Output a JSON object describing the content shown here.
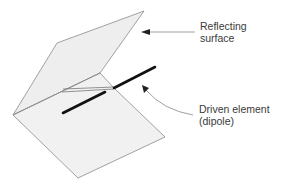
{
  "diagram": {
    "colors": {
      "background": "#ffffff",
      "panel_fill": "#eeeeee",
      "panel_edge": "#8a8a8a",
      "dipole": "#111111",
      "arrow": "#555555",
      "text": "#3a3a3a"
    },
    "labels": {
      "reflecting_surface": {
        "line1": "Reflecting",
        "line2": "surface"
      },
      "driven_element": {
        "line1": "Driven element",
        "line2": "(dipole)"
      }
    }
  }
}
